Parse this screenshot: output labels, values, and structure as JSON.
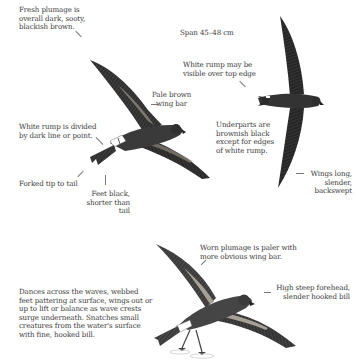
{
  "page": {
    "span": "Span 45–48 cm"
  },
  "labels": {
    "fresh_plumage": "Fresh plumage is\noverall dark, sooty,\nblackish brown.",
    "white_rump_divided": "White rump is divided\nby dark line or point.",
    "forked_tail": "Forked tip to tail",
    "feet_black": "Feet black,\nshorter than tail",
    "pale_wing_bar": "Pale brown\nwing bar",
    "white_rump_visible": "White rump may be\nvisible over top edge",
    "underparts": "Underparts are\nbrownish black\nexcept for edges\nof white rump.",
    "wings_long": "Wings long,\nslender,\nbackswept",
    "worn_plumage": "Worn plumage is paler with\nmore obvious wing bar.",
    "forehead": "High steep forehead,\nslender hooked bill",
    "behavior": "Dances across the waves, webbed\nfeet pattering at surface, wings out or\nup to lift or balance as wave crests\nsurge underneath. Snatches small\ncreatures from the water's surface\nwith fine, hooked bill."
  },
  "illustrations": [
    {
      "name": "bird-upperside-fresh",
      "view": "upperwing"
    },
    {
      "name": "bird-underside",
      "view": "underwing"
    },
    {
      "name": "bird-pattering-worn",
      "view": "feeding"
    }
  ],
  "colors": {
    "ink": "#2b2b2b",
    "wing_bar": "#8a8378",
    "text": "#3b3b3b"
  }
}
